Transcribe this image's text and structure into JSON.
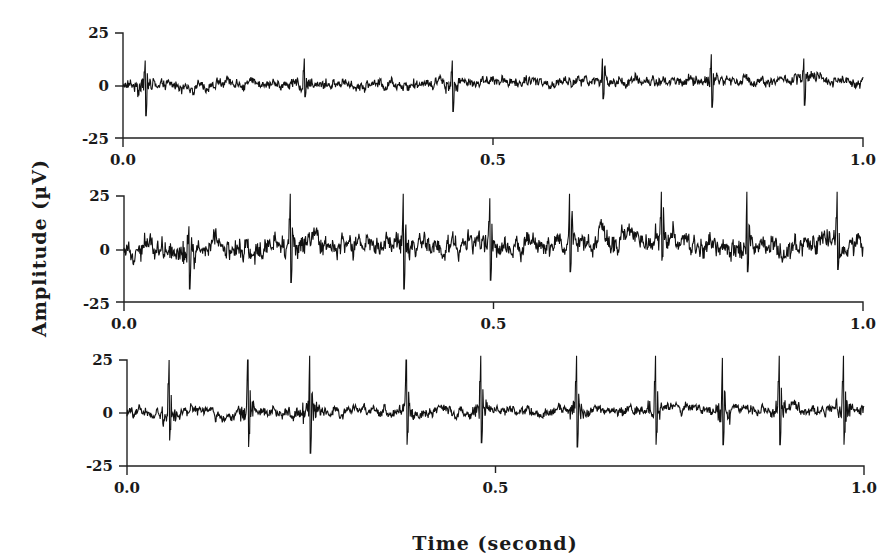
{
  "chart_data": {
    "type": "line",
    "title": "",
    "xlabel": "Time (second)",
    "ylabel": "Amplitude (µV)",
    "layout": "three vertically stacked panels, shared x-axis label, shared y-axis label",
    "grid": false,
    "legend": null,
    "panels": [
      {
        "id": "panel-1",
        "xlim": [
          0.0,
          1.0
        ],
        "ylim": [
          -25,
          25
        ],
        "xticks": [
          "0.0",
          "0.5",
          "1.0"
        ],
        "yticks": [
          "25",
          "0",
          "-25"
        ],
        "baseline_drift": [
          [
            0.0,
            0
          ],
          [
            0.3,
            1
          ],
          [
            0.6,
            2
          ],
          [
            1.0,
            3
          ]
        ],
        "noise_amplitude": 2.5,
        "events": [
          {
            "t": 0.03,
            "peak": 12,
            "trough": -14
          },
          {
            "t": 0.245,
            "peak": 13,
            "trough": -5
          },
          {
            "t": 0.445,
            "peak": 12,
            "trough": -12
          },
          {
            "t": 0.648,
            "peak": 13,
            "trough": -6
          },
          {
            "t": 0.795,
            "peak": 15,
            "trough": -10
          },
          {
            "t": 0.92,
            "peak": 13,
            "trough": -9
          }
        ]
      },
      {
        "id": "panel-2",
        "xlim": [
          0.0,
          1.0
        ],
        "ylim": [
          -25,
          25
        ],
        "xticks": [
          "0.0",
          "0.5",
          "1.0"
        ],
        "yticks": [
          "25",
          "0",
          "-25"
        ],
        "baseline_drift": [
          [
            0.0,
            2
          ],
          [
            0.2,
            1
          ],
          [
            0.4,
            2
          ],
          [
            0.6,
            3
          ],
          [
            0.73,
            7
          ],
          [
            0.82,
            -1
          ],
          [
            1.0,
            3
          ]
        ],
        "noise_amplitude": 5,
        "events": [
          {
            "t": 0.088,
            "peak": 11,
            "trough": -18
          },
          {
            "t": 0.225,
            "peak": 26,
            "trough": -15
          },
          {
            "t": 0.378,
            "peak": 26,
            "trough": -18
          },
          {
            "t": 0.495,
            "peak": 24,
            "trough": -14
          },
          {
            "t": 0.603,
            "peak": 26,
            "trough": -10
          },
          {
            "t": 0.727,
            "peak": 27,
            "trough": -5
          },
          {
            "t": 0.843,
            "peak": 27,
            "trough": -10
          },
          {
            "t": 0.965,
            "peak": 27,
            "trough": -9
          }
        ]
      },
      {
        "id": "panel-3",
        "xlim": [
          0.0,
          1.0
        ],
        "ylim": [
          -25,
          25
        ],
        "xticks": [
          "0.0",
          "0.5",
          "1.0"
        ],
        "yticks": [
          "25",
          "0",
          "-25"
        ],
        "baseline_drift": [
          [
            0.0,
            0
          ],
          [
            0.5,
            1
          ],
          [
            1.0,
            2
          ]
        ],
        "noise_amplitude": 2.5,
        "events": [
          {
            "t": 0.057,
            "peak": 25,
            "trough": -13
          },
          {
            "t": 0.164,
            "peak": 25,
            "trough": -16
          },
          {
            "t": 0.248,
            "peak": 27,
            "trough": -19
          },
          {
            "t": 0.379,
            "peak": 25,
            "trough": -15
          },
          {
            "t": 0.48,
            "peak": 27,
            "trough": -14
          },
          {
            "t": 0.61,
            "peak": 27,
            "trough": -16
          },
          {
            "t": 0.717,
            "peak": 27,
            "trough": -15
          },
          {
            "t": 0.808,
            "peak": 26,
            "trough": -15
          },
          {
            "t": 0.885,
            "peak": 27,
            "trough": -15
          },
          {
            "t": 0.972,
            "peak": 27,
            "trough": -15
          }
        ]
      }
    ]
  },
  "panels_geometry": [
    {
      "x0": 123,
      "x1": 863,
      "y_top": 33,
      "y_zero": 86,
      "y_bottom": 138
    },
    {
      "x0": 124,
      "x1": 863,
      "y_top": 196,
      "y_zero": 250,
      "y_bottom": 302
    },
    {
      "x0": 127,
      "x1": 864,
      "y_top": 360,
      "y_zero": 413,
      "y_bottom": 466
    }
  ]
}
